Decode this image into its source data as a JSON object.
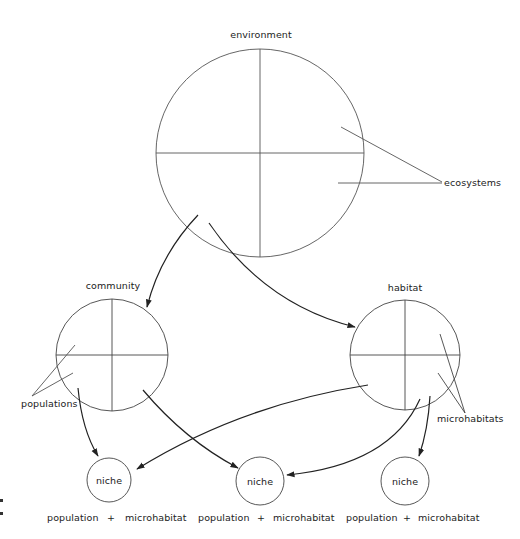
{
  "diagram": {
    "type": "hierarchy",
    "colors": {
      "line": "#333333",
      "text": "#222222",
      "background": "#ffffff"
    },
    "nodes": {
      "environment": {
        "label": "environment"
      },
      "community": {
        "label": "community"
      },
      "habitat": {
        "label": "habitat"
      },
      "niches": [
        {
          "label": "niche",
          "formula": {
            "left": "population",
            "op": "+",
            "right": "microhabitat"
          }
        },
        {
          "label": "niche",
          "formula": {
            "left": "population",
            "op": "+",
            "right": "microhabitat"
          }
        },
        {
          "label": "niche",
          "formula": {
            "left": "population",
            "op": "+",
            "right": "microhabitat"
          }
        }
      ]
    },
    "callouts": {
      "ecosystems": "ecosystems",
      "populations": "populations",
      "microhabitats": "microhabitats"
    },
    "edges": [
      {
        "from": "environment",
        "to": "community"
      },
      {
        "from": "environment",
        "to": "habitat"
      },
      {
        "from": "community",
        "to": "niche-1"
      },
      {
        "from": "community",
        "to": "niche-2"
      },
      {
        "from": "habitat",
        "to": "niche-1"
      },
      {
        "from": "habitat",
        "to": "niche-2"
      },
      {
        "from": "habitat",
        "to": "niche-3"
      }
    ]
  }
}
